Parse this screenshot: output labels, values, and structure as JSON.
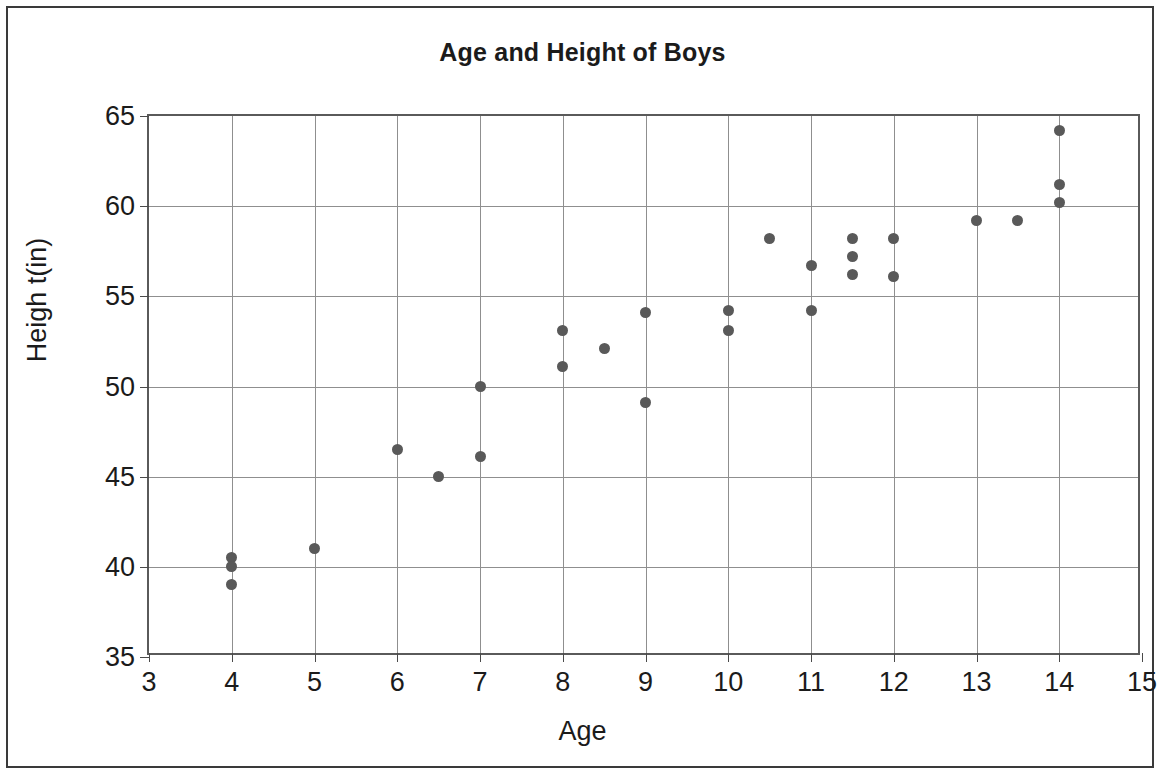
{
  "chart_data": {
    "type": "scatter",
    "title": "Age and Height of Boys",
    "xlabel": "Age",
    "ylabel": "Heigh t(in)",
    "xlim": [
      3,
      15
    ],
    "ylim": [
      35,
      65
    ],
    "xticks": [
      3,
      4,
      5,
      6,
      7,
      8,
      9,
      10,
      11,
      12,
      13,
      14,
      15
    ],
    "yticks": [
      35,
      40,
      45,
      50,
      55,
      60,
      65
    ],
    "grid": true,
    "legend": null,
    "marker_color": "#595959",
    "points": [
      {
        "x": 4,
        "y": 40.5
      },
      {
        "x": 4,
        "y": 40.0
      },
      {
        "x": 4,
        "y": 39.0
      },
      {
        "x": 5,
        "y": 41.0
      },
      {
        "x": 6,
        "y": 46.5
      },
      {
        "x": 6.5,
        "y": 45.0
      },
      {
        "x": 7,
        "y": 50.0
      },
      {
        "x": 7,
        "y": 46.1
      },
      {
        "x": 8,
        "y": 53.1
      },
      {
        "x": 8,
        "y": 51.1
      },
      {
        "x": 8.5,
        "y": 52.1
      },
      {
        "x": 9,
        "y": 54.1
      },
      {
        "x": 9,
        "y": 49.1
      },
      {
        "x": 10,
        "y": 54.2
      },
      {
        "x": 10,
        "y": 53.1
      },
      {
        "x": 10.5,
        "y": 58.2
      },
      {
        "x": 11,
        "y": 56.7
      },
      {
        "x": 11,
        "y": 54.2
      },
      {
        "x": 11.5,
        "y": 58.2
      },
      {
        "x": 11.5,
        "y": 57.2
      },
      {
        "x": 11.5,
        "y": 56.2
      },
      {
        "x": 12,
        "y": 58.2
      },
      {
        "x": 12,
        "y": 56.1
      },
      {
        "x": 13,
        "y": 59.2
      },
      {
        "x": 13.5,
        "y": 59.2
      },
      {
        "x": 14,
        "y": 64.2
      },
      {
        "x": 14,
        "y": 61.2
      },
      {
        "x": 14,
        "y": 60.2
      }
    ]
  }
}
